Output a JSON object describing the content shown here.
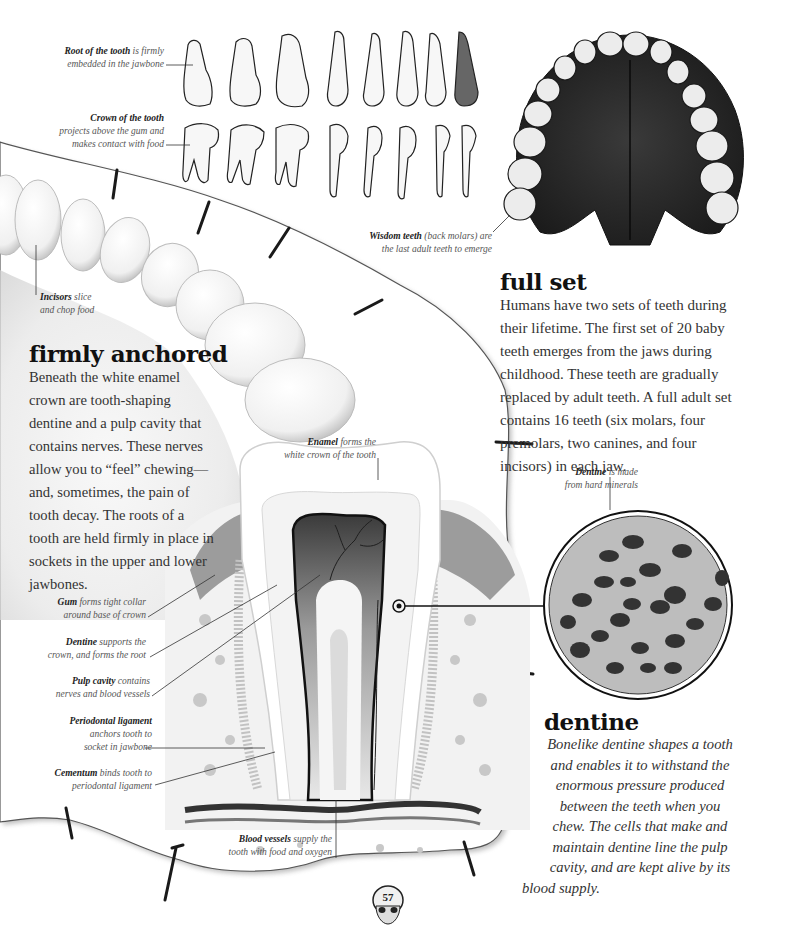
{
  "page": {
    "number": "57",
    "colors": {
      "paper": "#ffffff",
      "ink": "#2a2a2a",
      "heading": "#111111",
      "caption": "#555555"
    }
  },
  "top_captions": {
    "root": {
      "bold": "Root of the tooth",
      "rest_line1": " is firmly",
      "line2": "embedded in the jawbone"
    },
    "crown": {
      "bold": "Crown of the tooth",
      "line2": "projects above the gum and",
      "line3": "makes contact with food"
    },
    "wisdom": {
      "bold": "Wisdom teeth",
      "rest_line1": " (back molars) are",
      "line2": "the last adult teeth to emerge"
    }
  },
  "incisors_caption": {
    "bold": "Incisors",
    "rest_line1": " slice",
    "line2": "and chop food"
  },
  "full_set": {
    "heading": "full set",
    "body": "Humans have two sets of teeth during their lifetime. The first set of 20 baby teeth emerges from the jaws during childhood. These teeth are gradually replaced by adult teeth. A full adult set contains 16 teeth (six molars, four premolars, two canines, and four incisors) in each jaw."
  },
  "firmly_anchored": {
    "heading": "firmly anchored",
    "body": "Beneath the white enamel crown are tooth-shaping dentine and a pulp cavity that contains nerves. These nerves allow you to “feel” chewing—and, sometimes, the pain of tooth decay. The roots of a tooth are held firmly in place in sockets in the upper and lower jawbones."
  },
  "tooth_labels": {
    "enamel": {
      "bold": "Enamel",
      "rest_line1": " forms the",
      "line2": "white crown of the tooth"
    },
    "gum": {
      "bold": "Gum",
      "rest_line1": " forms tight collar",
      "line2": "around base of crown"
    },
    "dentine": {
      "bold": "Dentine",
      "rest_line1": " supports the",
      "line2": "crown, and forms the root"
    },
    "pulp": {
      "bold": "Pulp cavity",
      "rest_line1": " contains",
      "line2": "nerves and blood vessels"
    },
    "periodontal": {
      "bold": "Periodontal ligament",
      "line2": "anchors tooth to",
      "line3": "socket in jawbone"
    },
    "cementum": {
      "bold": "Cementum",
      "rest_line1": " binds tooth to",
      "line2": "periodontal ligament"
    },
    "blood": {
      "bold": "Blood vessels",
      "rest_line1": " supply the",
      "line2": "tooth with food and oxygen"
    }
  },
  "dentine_inset": {
    "bold": "Dentine",
    "rest_line1": " is made",
    "line2": "from hard minerals"
  },
  "dentine_section": {
    "heading": "dentine",
    "lines": [
      "Bonelike dentine shapes a tooth",
      "and enables it to withstand the",
      "enormous pressure produced",
      "between the teeth when you",
      "chew. The cells that make and",
      "maintain dentine line the pulp",
      "cavity, and are kept alive by its",
      "blood supply."
    ]
  }
}
